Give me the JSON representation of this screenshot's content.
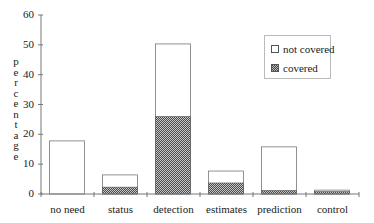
{
  "chart_data": {
    "type": "bar",
    "stacked": true,
    "title": "",
    "xlabel": "",
    "ylabel": "percentage",
    "ylim": [
      0,
      60
    ],
    "yticks": [
      "0",
      "10",
      "20",
      "30",
      "40",
      "50",
      "60"
    ],
    "categories": [
      "no need",
      "status",
      "detection",
      "estimates",
      "prediction",
      "control"
    ],
    "series": [
      {
        "name": "covered",
        "values": [
          0,
          2.3,
          26,
          3.7,
          1.2,
          0.8
        ],
        "fill": "pattern"
      },
      {
        "name": "not covered",
        "values": [
          17.8,
          4.1,
          24.3,
          4.0,
          14.6,
          0.5
        ],
        "fill": "#ffffff"
      }
    ],
    "totals": [
      17.8,
      6.4,
      50.3,
      7.7,
      15.8,
      1.3
    ],
    "legend": {
      "position": "upper right",
      "entries": [
        "not covered",
        "covered"
      ]
    },
    "grid": false
  },
  "legend": {
    "not_covered_label": "not covered",
    "covered_label": "covered"
  },
  "axis": {
    "ylabel_letters": [
      "p",
      "e",
      "r",
      "c",
      "e",
      "n",
      "t",
      "a",
      "g",
      "e"
    ]
  }
}
